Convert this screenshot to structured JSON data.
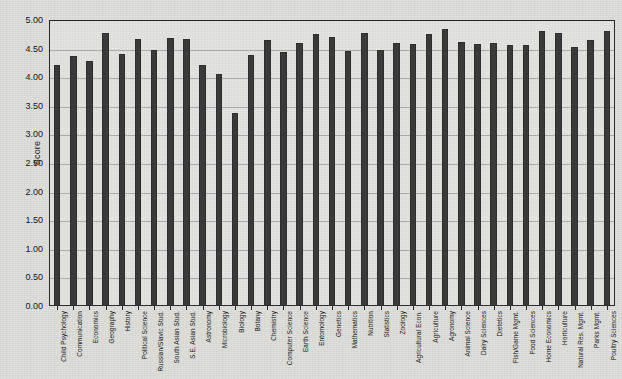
{
  "chart_data": {
    "type": "bar",
    "title": "",
    "xlabel": "",
    "ylabel": "Score",
    "ylim": [
      0.0,
      5.0
    ],
    "ytick_labels": [
      "0.00",
      "0.50",
      "1.00",
      "1.50",
      "2.00",
      "2.50",
      "3.00",
      "3.50",
      "4.00",
      "4.50",
      "5.00"
    ],
    "ytick_values": [
      0.0,
      0.5,
      1.0,
      1.5,
      2.0,
      2.5,
      3.0,
      3.5,
      4.0,
      4.5,
      5.0
    ],
    "grid": true,
    "legend": "none",
    "categories": [
      "Child Psychology",
      "Communication",
      "Economics",
      "Geography",
      "History",
      "Political  Science",
      "Russian/Slavic Stud.",
      "South Asian Stud.",
      "S.E. Asian Stud.",
      "Astronomy",
      "Microbiology",
      "Biology",
      "Botany",
      "Chemistry",
      "Computer Science",
      "Earth Science",
      "Entomology",
      "Genetics",
      "Mathematics",
      "Nutrition",
      "Statistics",
      "Zoology",
      "Agricultural Econ.",
      "Agriculture",
      "Agronomy",
      "Animal Science",
      "Dairy Sciences",
      "Dietetics",
      "Fish/Game Mgmt.",
      "Food Sciences",
      "Home Economics",
      "Horticulture",
      "Natural Res. Mgmt.",
      "Parks Mgmt.",
      "Poultry Sciences"
    ],
    "values": [
      4.22,
      4.37,
      4.28,
      4.77,
      4.41,
      4.66,
      4.48,
      4.69,
      4.67,
      4.22,
      4.06,
      3.38,
      4.39,
      4.65,
      4.44,
      4.6,
      4.75,
      4.7,
      4.46,
      4.77,
      4.48,
      4.6,
      4.58,
      4.75,
      4.84,
      4.62,
      4.58,
      4.6,
      4.56,
      4.57,
      4.81,
      4.77,
      4.52,
      4.65,
      4.8
    ]
  }
}
